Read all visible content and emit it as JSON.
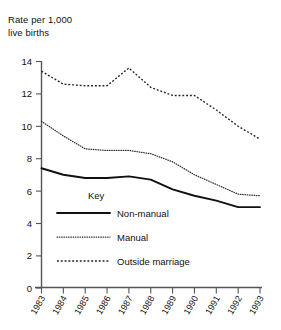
{
  "chart_data": {
    "type": "line",
    "title": "",
    "ylabel": "Rate per 1,000\nlive births",
    "xlabel": "",
    "ylim": [
      0,
      14
    ],
    "yticks": [
      0,
      2,
      4,
      6,
      8,
      10,
      12,
      14
    ],
    "grid": false,
    "legend_position": "inside-lower-left",
    "legend_title": "Key",
    "categories": [
      "1983",
      "1984",
      "1985",
      "1986",
      "1987",
      "1988",
      "1989",
      "1990",
      "1991",
      "1992",
      "1993"
    ],
    "series": [
      {
        "name": "Non-manual",
        "style": "solid",
        "values": [
          7.4,
          7.0,
          6.8,
          6.8,
          6.9,
          6.7,
          6.1,
          5.7,
          5.4,
          5.0,
          5.0
        ]
      },
      {
        "name": "Manual",
        "style": "dotted",
        "values": [
          10.3,
          9.4,
          8.6,
          8.5,
          8.5,
          8.3,
          7.8,
          7.0,
          6.4,
          5.8,
          5.7
        ]
      },
      {
        "name": "Outside marriage",
        "style": "dashed",
        "values": [
          13.4,
          12.6,
          12.5,
          12.5,
          13.6,
          12.4,
          11.9,
          11.9,
          11.0,
          10.0,
          9.2
        ]
      }
    ]
  },
  "axis": {
    "y_title": "Rate per 1,000\nlive births",
    "y_tick_labels": [
      "14",
      "12",
      "10",
      "8",
      "6",
      "4",
      "2",
      "0"
    ],
    "x_tick_labels": [
      "1983",
      "1984",
      "1985",
      "1986",
      "1987",
      "1988",
      "1989",
      "1990",
      "1991",
      "1992",
      "1993"
    ]
  },
  "legend": {
    "title": "Key",
    "items": [
      {
        "label": "Non-manual",
        "style": "solid"
      },
      {
        "label": "Manual",
        "style": "dotted"
      },
      {
        "label": "Outside marriage",
        "style": "dashed"
      }
    ]
  }
}
